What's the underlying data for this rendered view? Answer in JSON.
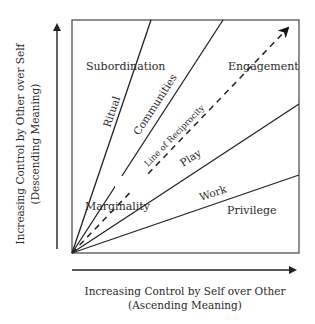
{
  "diagram": {
    "axes": {
      "y_label_line1": "Increasing Control by Other over Self",
      "y_label_line2": "(Descending Meaning)",
      "x_label_line1": "Increasing Control by Self over Other",
      "x_label_line2": "(Ascending Meaning)"
    },
    "regions": {
      "subordination": "Subordination",
      "engagement": "Engagement",
      "marginality": "Marginality",
      "privilege": "Privilege"
    },
    "boundary_lines": {
      "ritual": "Ritual",
      "communities": "Communities",
      "reciprocity": "Line of Reciprocity",
      "play": "Play",
      "work": "Work"
    }
  }
}
